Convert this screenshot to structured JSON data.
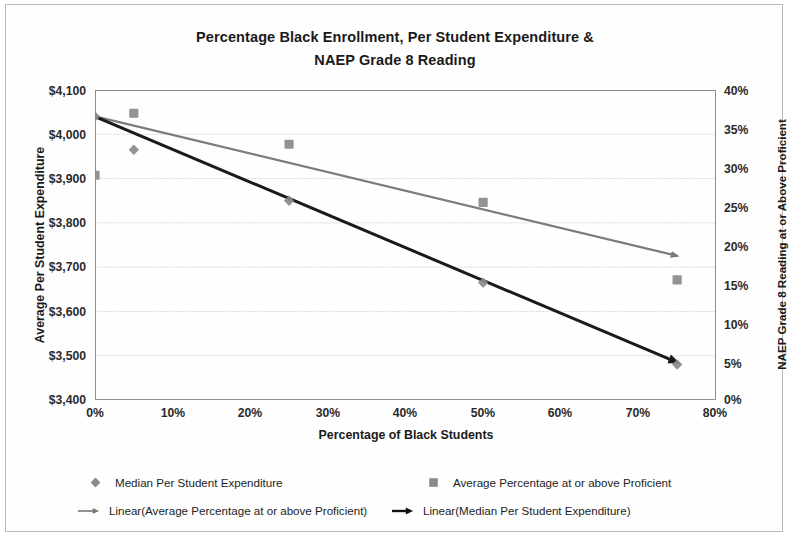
{
  "chart_data": {
    "type": "scatter",
    "title": "Percentage Black Enrollment, Per Student Expenditure & NAEP Grade 8 Reading",
    "title_line1": "Percentage Black Enrollment, Per Student Expenditure &",
    "title_line2": "NAEP Grade 8 Reading",
    "xlabel": "Percentage of Black Students",
    "ylabel": "Average Per Student Expenditure",
    "y2label": "NAEP Grade 8 Reading at or Above Proficient",
    "xlim": [
      0,
      80
    ],
    "ylim": [
      3400,
      4100
    ],
    "y2lim": [
      0,
      40
    ],
    "x_ticks": [
      "0%",
      "10%",
      "20%",
      "30%",
      "40%",
      "50%",
      "60%",
      "70%",
      "80%"
    ],
    "x_tick_values": [
      0,
      10,
      20,
      30,
      40,
      50,
      60,
      70,
      80
    ],
    "y_ticks": [
      "$3,400",
      "$3,500",
      "$3,600",
      "$3,700",
      "$3,800",
      "$3,900",
      "$4,000",
      "$4,100"
    ],
    "y_tick_values": [
      3400,
      3500,
      3600,
      3700,
      3800,
      3900,
      4000,
      4100
    ],
    "y2_ticks": [
      "0%",
      "5%",
      "10%",
      "15%",
      "20%",
      "25%",
      "30%",
      "35%",
      "40%"
    ],
    "y2_tick_values": [
      0,
      5,
      10,
      15,
      20,
      25,
      30,
      35,
      40
    ],
    "grid": "horizontal",
    "legend_position": "bottom",
    "series": [
      {
        "name": "Median Per Student Expenditure",
        "marker": "diamond",
        "axis": "left",
        "color": "#8a8a8a",
        "x": [
          0,
          5,
          25,
          50,
          75
        ],
        "values": [
          4040,
          3965,
          3850,
          3665,
          3480
        ]
      },
      {
        "name": "Average Percentage at or above Proficient",
        "marker": "square",
        "axis": "right",
        "color": "#8a8a8a",
        "x": [
          0,
          5,
          25,
          50,
          75
        ],
        "values": [
          29,
          37,
          33,
          25.5,
          15.5
        ]
      },
      {
        "name": "Linear(Average Percentage at or above Proficient)",
        "marker": "line-arrow",
        "axis": "right",
        "color": "#7b7b7b",
        "x": [
          0,
          75
        ],
        "values": [
          36.6,
          18.6
        ]
      },
      {
        "name": "Linear(Median Per Student Expenditure)",
        "marker": "line-arrow",
        "axis": "left",
        "color": "#1a1a1a",
        "x": [
          0,
          75
        ],
        "values": [
          4040,
          3485
        ]
      }
    ]
  },
  "legend": {
    "entries": [
      {
        "label": "Median Per Student Expenditure",
        "marker": "diamond-marker-icon"
      },
      {
        "label": "Average Percentage at or above Proficient",
        "marker": "square-marker-icon"
      },
      {
        "label": "Linear(Average Percentage at or above Proficient)",
        "marker": "gray-trendline-icon"
      },
      {
        "label": "Linear(Median Per Student Expenditure)",
        "marker": "black-trendline-icon"
      }
    ]
  },
  "colors": {
    "series_gray": "#8a8a8a",
    "trend_gray": "#7b7b7b",
    "trend_black": "#1a1a1a",
    "grid": "#c7c7c7",
    "axis": "#8e8e8e",
    "text": "#1a1a1a"
  }
}
